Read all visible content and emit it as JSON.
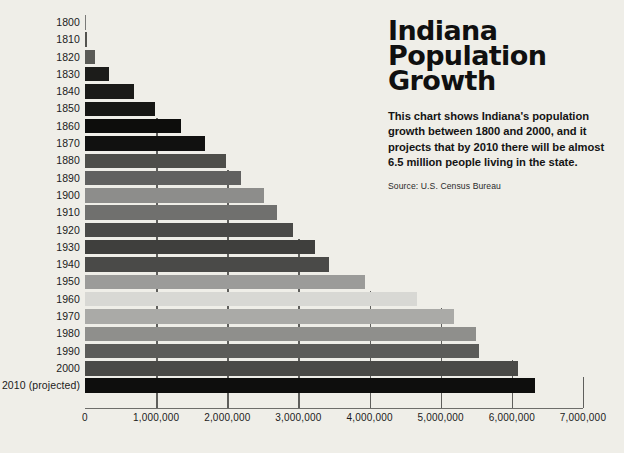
{
  "panel": {
    "title_lines": [
      "Indiana",
      "Population",
      "Growth"
    ],
    "description": "This chart shows Indiana's population growth between 1800 and 2000, and it projects that by 2010 there will be almost 6.5 million people living in the state.",
    "source": "Source: U.S. Census Bureau"
  },
  "colors": {
    "background": "#efeee8",
    "axis": "#6d6d6a",
    "gridline": "#5f5f5c",
    "text": "#1b1b1b"
  },
  "chart_data": {
    "type": "bar",
    "orientation": "horizontal",
    "xlabel": "",
    "ylabel": "",
    "xlim": [
      0,
      7000000
    ],
    "grid": true,
    "legend": false,
    "xticks": [
      0,
      1000000,
      2000000,
      3000000,
      4000000,
      5000000,
      6000000,
      7000000
    ],
    "xtick_labels": [
      "0",
      "1,000,000",
      "2,000,000",
      "3,000,000",
      "4,000,000",
      "5,000,000",
      "6,000,000",
      "7,000,000"
    ],
    "categories": [
      "1800",
      "1810",
      "1820",
      "1830",
      "1840",
      "1850",
      "1860",
      "1870",
      "1880",
      "1890",
      "1900",
      "1910",
      "1920",
      "1930",
      "1940",
      "1950",
      "1960",
      "1970",
      "1980",
      "1990",
      "2000",
      "2010 (projected)"
    ],
    "values": [
      2632,
      24520,
      147178,
      343031,
      685866,
      988416,
      1350428,
      1680637,
      1978301,
      2192404,
      2516462,
      2700876,
      2930390,
      3238503,
      3427796,
      3934224,
      4662498,
      5193669,
      5490224,
      5544159,
      6080485,
      6318900
    ],
    "bars": [
      {
        "label": "1800",
        "value": 2632,
        "color": "#7a7a78"
      },
      {
        "label": "1810",
        "value": 24520,
        "color": "#53534f"
      },
      {
        "label": "1820",
        "value": 147178,
        "color": "#5a5a56"
      },
      {
        "label": "1830",
        "value": 343031,
        "color": "#1c1c1a"
      },
      {
        "label": "1840",
        "value": 685866,
        "color": "#1a1a18"
      },
      {
        "label": "1850",
        "value": 988416,
        "color": "#161614"
      },
      {
        "label": "1860",
        "value": 1350428,
        "color": "#0d0d0c"
      },
      {
        "label": "1870",
        "value": 1680637,
        "color": "#111110"
      },
      {
        "label": "1880",
        "value": 1978301,
        "color": "#4e4e4a"
      },
      {
        "label": "1890",
        "value": 2192404,
        "color": "#616160"
      },
      {
        "label": "1900",
        "value": 2516462,
        "color": "#8d8d8b"
      },
      {
        "label": "1910",
        "value": 2700876,
        "color": "#70706e"
      },
      {
        "label": "1920",
        "value": 2930390,
        "color": "#4a4a48"
      },
      {
        "label": "1930",
        "value": 3238503,
        "color": "#3f3f3d"
      },
      {
        "label": "1940",
        "value": 3427796,
        "color": "#4a4a48"
      },
      {
        "label": "1950",
        "value": 3934224,
        "color": "#9b9b99"
      },
      {
        "label": "1960",
        "value": 4662498,
        "color": "#d8d8d4"
      },
      {
        "label": "1970",
        "value": 5193669,
        "color": "#aaaaa7"
      },
      {
        "label": "1980",
        "value": 5490224,
        "color": "#8f8f8c"
      },
      {
        "label": "1990",
        "value": 5544159,
        "color": "#5c5c59"
      },
      {
        "label": "2000",
        "value": 6080485,
        "color": "#4a4a47"
      },
      {
        "label": "2010 (projected)",
        "value": 6318900,
        "color": "#0e0e0d"
      }
    ]
  }
}
